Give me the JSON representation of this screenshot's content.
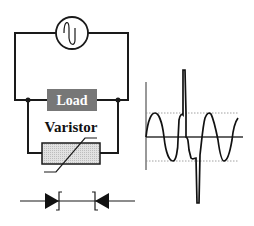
{
  "diagram": {
    "source": {
      "label": "",
      "icon": "ac-source-icon"
    },
    "load": {
      "label": "Load",
      "fill": "#777777"
    },
    "varistor": {
      "label": "Varistor",
      "fill": "#d9d9d9"
    },
    "symbol": {
      "name": "bidirectional-zener-diode-symbol"
    },
    "waveform": {
      "name": "sine-wave-with-transient-spike",
      "dotted_color": "#888888",
      "trace_color": "#111111"
    }
  }
}
